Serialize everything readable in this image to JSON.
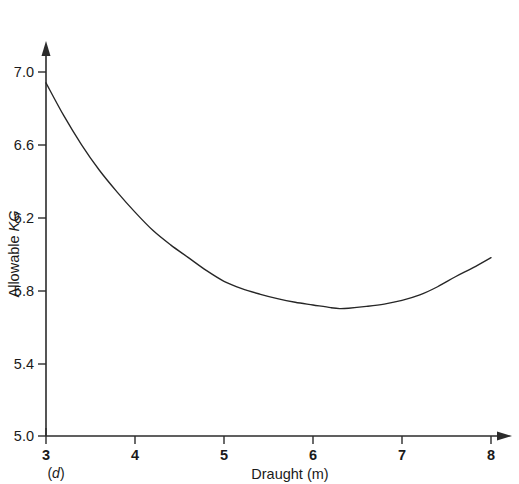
{
  "chart_data": {
    "type": "line",
    "title": "",
    "xlabel": "Draught (m)",
    "ylabel_prefix": "Allowable ",
    "ylabel_italic": "KG",
    "ylabel": "Allowable KG",
    "panel_label_open": "(",
    "panel_label_italic": "d",
    "panel_label_close": ")",
    "panel_label": "(d)",
    "xlim": [
      3,
      8
    ],
    "ylim": [
      5.0,
      7.0
    ],
    "grid": false,
    "legend": "none",
    "xticks": [
      3,
      4,
      5,
      6,
      7,
      8
    ],
    "xtick_labels": [
      "3",
      "4",
      "5",
      "6",
      "7",
      "8"
    ],
    "yticks": [
      5.0,
      5.4,
      5.8,
      6.2,
      6.6,
      7.0
    ],
    "ytick_labels": [
      "5.0",
      "5.4",
      "5.8",
      "6.2",
      "6.6",
      "7.0"
    ],
    "series": [
      {
        "name": "Allowable KG curve",
        "x": [
          3.0,
          3.2,
          3.4,
          3.6,
          3.8,
          4.0,
          4.2,
          4.4,
          4.6,
          4.8,
          5.0,
          5.2,
          5.4,
          5.6,
          5.8,
          6.0,
          6.2,
          6.3,
          6.4,
          6.6,
          6.8,
          7.0,
          7.2,
          7.4,
          7.6,
          7.8,
          8.0
        ],
        "y": [
          6.94,
          6.76,
          6.6,
          6.46,
          6.34,
          6.23,
          6.13,
          6.05,
          5.98,
          5.91,
          5.85,
          5.81,
          5.78,
          5.755,
          5.735,
          5.72,
          5.705,
          5.7,
          5.702,
          5.712,
          5.725,
          5.745,
          5.775,
          5.82,
          5.875,
          5.925,
          5.98
        ]
      }
    ],
    "annotations": {
      "minimum_x": 6.3,
      "minimum_y": 5.7,
      "start_x": 3.0,
      "start_y": 6.94,
      "end_x": 8.0,
      "end_y": 5.98
    },
    "colors": {
      "curve": "#262626",
      "axis": "#2b2b2b",
      "background": "#ffffff"
    }
  }
}
